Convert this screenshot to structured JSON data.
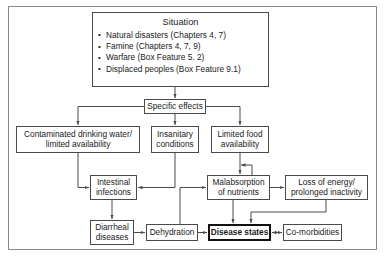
{
  "figure": {
    "type": "flowchart"
  },
  "nodes": {
    "situation": {
      "title": "Situation",
      "items": [
        "Natural disasters (Chapters 4, 7)",
        "Famine (Chapters 4, 7, 9)",
        "Warfare (Box Feature 5. 2)",
        "Displaced peoples (Box Feature 9.1)"
      ]
    },
    "specific_effects": {
      "label": "Specific effects"
    },
    "contaminated_water": {
      "line1": "Contaminated drinking water/",
      "line2": "limited availability"
    },
    "insanitary": {
      "line1": "Insanitary",
      "line2": "conditions"
    },
    "limited_food": {
      "line1": "Limited food",
      "line2": "availability"
    },
    "intestinal": {
      "line1": "Intestinal",
      "line2": "infections"
    },
    "malabsorption": {
      "line1": "Malabsorption",
      "line2": "of nutrients"
    },
    "loss_energy": {
      "line1": "Loss of energy/",
      "line2": "prolonged inactivity"
    },
    "diarrheal": {
      "line1": "Diarrheal",
      "line2": "diseases"
    },
    "dehydration": {
      "label": "Dehydration"
    },
    "disease_states": {
      "label": "Disease states"
    },
    "co_morbidities": {
      "label": "Co-morbidities"
    }
  },
  "colors": {
    "box_border": "#4a4a4a",
    "emphasis_border": "#111111",
    "frame_border": "#8b8b8b",
    "edge": "#4a4a4a",
    "text": "#1a1a1a",
    "background": "#ffffff"
  }
}
